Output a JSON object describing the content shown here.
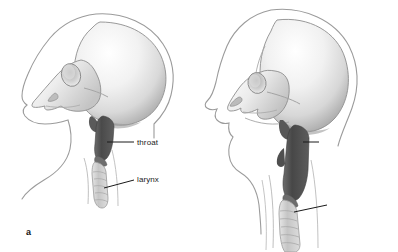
{
  "figure": {
    "background_color": "#ffffff",
    "style": "grayscale airbrush anatomical illustration",
    "panels": [
      {
        "id": "a",
        "letter": "a",
        "subject": "infant skull and upper airway, lateral view",
        "labels": [
          {
            "id": "throat",
            "text": "throat"
          },
          {
            "id": "larynx",
            "text": "larynx"
          }
        ]
      },
      {
        "id": "b",
        "letter": "b",
        "subject": "adult skull and upper airway, lateral view",
        "labels": [
          {
            "id": "throat",
            "text": "throat"
          },
          {
            "id": "larynx",
            "text": "larynx"
          }
        ]
      }
    ]
  },
  "colors": {
    "background": "#ffffff",
    "bone_light": "#f4f4f4",
    "bone_mid": "#d8d8d8",
    "bone_shadow": "#9a9a9a",
    "pharynx_dark": "#4e4e4e",
    "trachea_light": "#c9c9c9",
    "outline": "#8d8d8d",
    "leader_line": "#1a1a1a",
    "text": "#1a1a1a"
  }
}
